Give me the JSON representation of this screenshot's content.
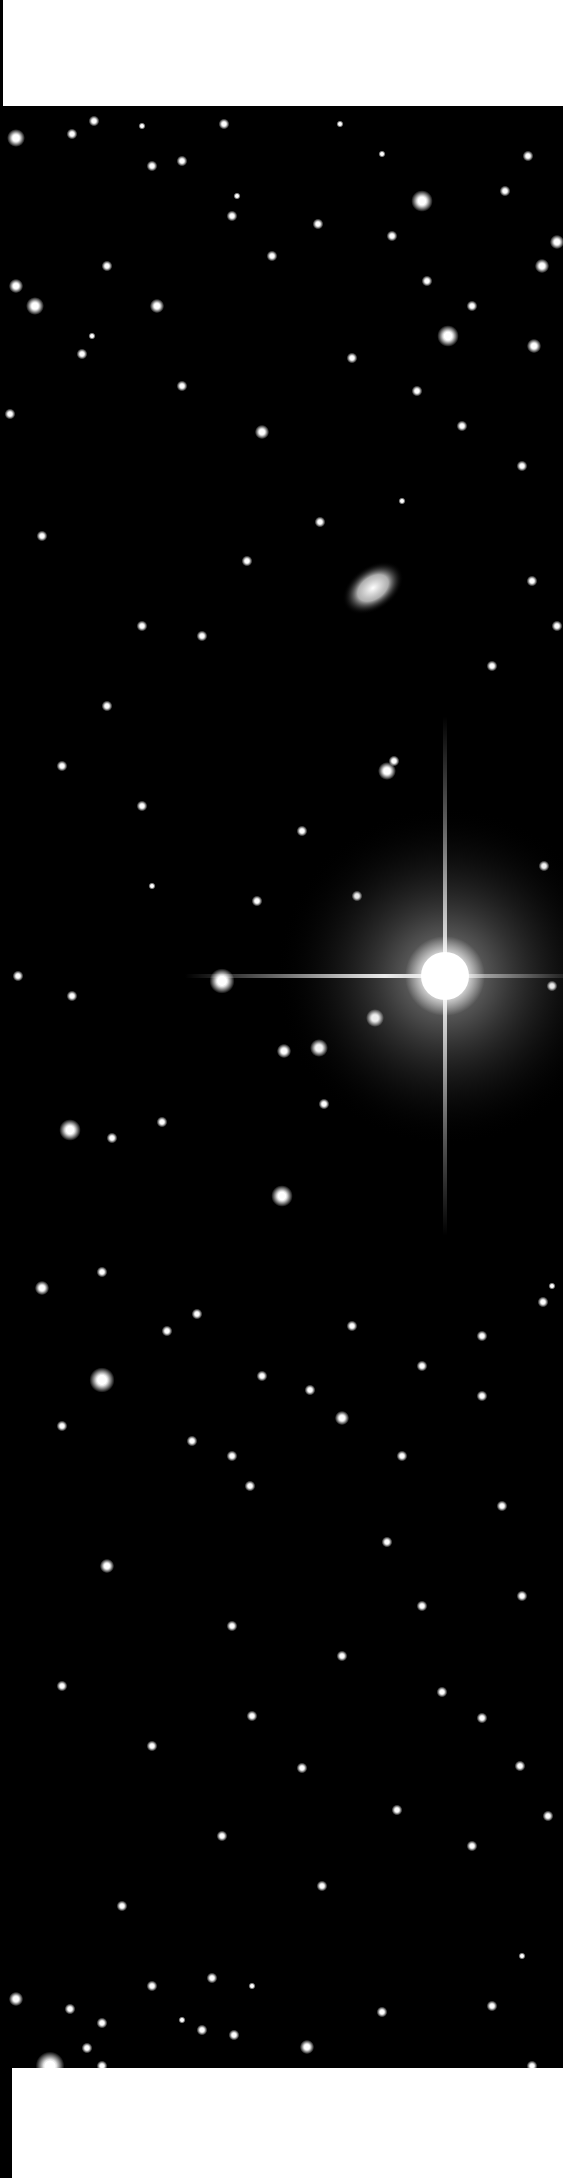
{
  "image": {
    "subject": "deep-sky star field photograph",
    "palette": {
      "background": "#000000",
      "page": "#ffffff",
      "star": "#ffffff"
    },
    "features": {
      "bright_star": {
        "cx": 443,
        "cy": 870,
        "r": 34,
        "spike_length": 260
      },
      "galaxy": {
        "cx": 371,
        "cy": 482,
        "rx": 34,
        "ry": 22,
        "rotation": -35
      }
    },
    "stars": [
      [
        14,
        32,
        5
      ],
      [
        92,
        15,
        3
      ],
      [
        70,
        28,
        3
      ],
      [
        140,
        20,
        2
      ],
      [
        222,
        18,
        3
      ],
      [
        338,
        18,
        2
      ],
      [
        380,
        48,
        2
      ],
      [
        420,
        95,
        6
      ],
      [
        503,
        85,
        3
      ],
      [
        526,
        50,
        3
      ],
      [
        555,
        136,
        4
      ],
      [
        446,
        230,
        6
      ],
      [
        540,
        160,
        4
      ],
      [
        532,
        240,
        4
      ],
      [
        470,
        200,
        3
      ],
      [
        14,
        180,
        4
      ],
      [
        33,
        200,
        5
      ],
      [
        155,
        200,
        4
      ],
      [
        105,
        160,
        3
      ],
      [
        270,
        150,
        3
      ],
      [
        80,
        248,
        3
      ],
      [
        180,
        280,
        3
      ],
      [
        8,
        308,
        3
      ],
      [
        260,
        326,
        4
      ],
      [
        460,
        320,
        3
      ],
      [
        415,
        285,
        3
      ],
      [
        520,
        360,
        3
      ],
      [
        350,
        252,
        3
      ],
      [
        316,
        118,
        3
      ],
      [
        390,
        130,
        3
      ],
      [
        425,
        175,
        3
      ],
      [
        230,
        110,
        3
      ],
      [
        150,
        60,
        3
      ],
      [
        180,
        55,
        3
      ],
      [
        235,
        90,
        2
      ],
      [
        90,
        230,
        2
      ],
      [
        318,
        416,
        3
      ],
      [
        245,
        455,
        3
      ],
      [
        40,
        430,
        3
      ],
      [
        400,
        395,
        2
      ],
      [
        530,
        475,
        3
      ],
      [
        555,
        520,
        3
      ],
      [
        490,
        560,
        3
      ],
      [
        200,
        530,
        3
      ],
      [
        140,
        520,
        3
      ],
      [
        105,
        600,
        3
      ],
      [
        60,
        660,
        3
      ],
      [
        140,
        700,
        3
      ],
      [
        385,
        665,
        5
      ],
      [
        392,
        655,
        3
      ],
      [
        300,
        725,
        3
      ],
      [
        355,
        790,
        3
      ],
      [
        255,
        795,
        3
      ],
      [
        542,
        760,
        3
      ],
      [
        70,
        890,
        3
      ],
      [
        150,
        780,
        2
      ],
      [
        16,
        870,
        3
      ],
      [
        220,
        875,
        7
      ],
      [
        550,
        880,
        3
      ],
      [
        373,
        912,
        5
      ],
      [
        282,
        945,
        4
      ],
      [
        317,
        942,
        5
      ],
      [
        322,
        998,
        3
      ],
      [
        68,
        1024,
        6
      ],
      [
        110,
        1032,
        3
      ],
      [
        160,
        1016,
        3
      ],
      [
        280,
        1090,
        6
      ],
      [
        100,
        1166,
        3
      ],
      [
        40,
        1182,
        4
      ],
      [
        195,
        1208,
        3
      ],
      [
        260,
        1270,
        3
      ],
      [
        165,
        1225,
        3
      ],
      [
        350,
        1220,
        3
      ],
      [
        420,
        1260,
        3
      ],
      [
        480,
        1230,
        3
      ],
      [
        541,
        1196,
        3
      ],
      [
        550,
        1180,
        2
      ],
      [
        100,
        1274,
        7
      ],
      [
        60,
        1320,
        3
      ],
      [
        190,
        1335,
        3
      ],
      [
        230,
        1350,
        3
      ],
      [
        308,
        1284,
        3
      ],
      [
        340,
        1312,
        4
      ],
      [
        480,
        1290,
        3
      ],
      [
        400,
        1350,
        3
      ],
      [
        248,
        1380,
        3
      ],
      [
        500,
        1400,
        3
      ],
      [
        385,
        1436,
        3
      ],
      [
        105,
        1460,
        4
      ],
      [
        420,
        1500,
        3
      ],
      [
        230,
        1520,
        3
      ],
      [
        340,
        1550,
        3
      ],
      [
        250,
        1610,
        3
      ],
      [
        520,
        1490,
        3
      ],
      [
        440,
        1586,
        3
      ],
      [
        300,
        1662,
        3
      ],
      [
        395,
        1704,
        3
      ],
      [
        470,
        1740,
        3
      ],
      [
        518,
        1660,
        3
      ],
      [
        480,
        1612,
        3
      ],
      [
        60,
        1580,
        3
      ],
      [
        150,
        1640,
        3
      ],
      [
        220,
        1730,
        3
      ],
      [
        120,
        1800,
        3
      ],
      [
        320,
        1780,
        3
      ],
      [
        546,
        1710,
        3
      ],
      [
        150,
        1880,
        3
      ],
      [
        48,
        1960,
        8
      ],
      [
        14,
        1893,
        4
      ],
      [
        68,
        1903,
        3
      ],
      [
        200,
        1924,
        3
      ],
      [
        150,
        1988,
        3
      ],
      [
        128,
        1990,
        3
      ],
      [
        195,
        2012,
        3
      ],
      [
        305,
        1941,
        4
      ],
      [
        232,
        1929,
        3
      ],
      [
        180,
        1914,
        2
      ],
      [
        490,
        1900,
        3
      ],
      [
        530,
        1960,
        3
      ],
      [
        100,
        1960,
        3
      ],
      [
        210,
        1872,
        3
      ],
      [
        380,
        1906,
        3
      ],
      [
        85,
        1942,
        3
      ],
      [
        210,
        1995,
        3
      ],
      [
        140,
        1970,
        2
      ],
      [
        100,
        1917,
        3
      ],
      [
        250,
        1880,
        2
      ],
      [
        520,
        1850,
        2
      ],
      [
        410,
        1980,
        2
      ]
    ]
  }
}
